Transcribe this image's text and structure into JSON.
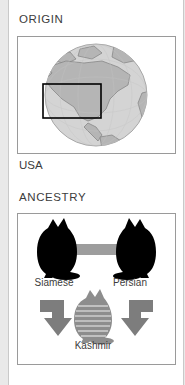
{
  "card": {
    "background": "#ffffff",
    "page_background": "#e9e9e9",
    "border_color": "#c9c9c9"
  },
  "origin": {
    "title": "ORIGIN",
    "caption": "USA",
    "panel": {
      "border_color": "#9a9a9a",
      "background": "#ffffff"
    },
    "globe": {
      "icon": "globe-north-america-icon",
      "ocean_color": "#d2d2d2",
      "land_color": "#b4b4b4",
      "outline_color": "#8d8d8d",
      "highlight_rect_color": "#000000",
      "highlight_region": "USA"
    }
  },
  "ancestry": {
    "title": "ANCESTRY",
    "panel": {
      "border_color": "#9a9a9a",
      "background": "#ffffff"
    },
    "parents": [
      {
        "name": "Siamese",
        "icon": "cat-silhouette-icon",
        "color": "#000000"
      },
      {
        "name": "Persian",
        "icon": "cat-silhouette-icon",
        "color": "#000000"
      }
    ],
    "cross_bar": {
      "icon": "cross-bar-icon",
      "color": "#9a9a9a"
    },
    "arrows": {
      "icon": "arrow-icon",
      "color": "#7d7d7d",
      "direction_left": "down-right",
      "direction_right": "down-left"
    },
    "offspring": {
      "name": "Kashmir",
      "icon": "cat-striped-icon",
      "color": "#8a8a8a"
    }
  }
}
